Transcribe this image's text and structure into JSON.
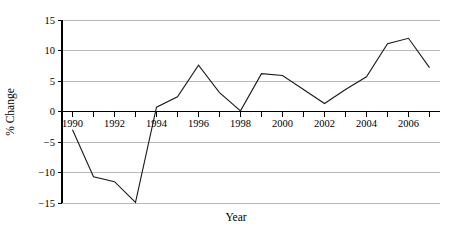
{
  "chart_data": {
    "type": "line",
    "title": "",
    "xlabel": "Year",
    "ylabel": "% Change",
    "xlim": [
      1989.5,
      2007.5
    ],
    "ylim": [
      -15,
      15
    ],
    "grid": true,
    "legend": false,
    "y_ticks": [
      15,
      10,
      5,
      0,
      -5,
      -10,
      -15
    ],
    "y_tick_labels": [
      "15",
      "10",
      "5",
      "0",
      "−5",
      "−10",
      "−15"
    ],
    "x_ticks": [
      1990,
      1991,
      1992,
      1993,
      1994,
      1995,
      1996,
      1997,
      1998,
      1999,
      2000,
      2001,
      2002,
      2003,
      2004,
      2005,
      2006,
      2007
    ],
    "x_tick_labels_shown": [
      "1990",
      "1992",
      "1994",
      "1996",
      "1998",
      "2000",
      "2002",
      "2004",
      "2006"
    ],
    "x_tick_labels_shown_values": [
      1990,
      1992,
      1994,
      1996,
      1998,
      2000,
      2002,
      2004,
      2006
    ],
    "x": [
      1990,
      1991,
      1992,
      1993,
      1994,
      1995,
      1996,
      1997,
      1998,
      1999,
      2000,
      2001,
      2002,
      2003,
      2004,
      2005,
      2006,
      2007
    ],
    "values": [
      -3.0,
      -10.7,
      -11.5,
      -14.9,
      0.7,
      2.4,
      7.6,
      3.1,
      0.1,
      6.2,
      5.9,
      3.6,
      1.3,
      3.6,
      5.7,
      11.1,
      12.0,
      7.2
    ],
    "series": [
      {
        "name": "% Change",
        "values": [
          -3.0,
          -10.7,
          -11.5,
          -14.9,
          0.7,
          2.4,
          7.6,
          3.1,
          0.1,
          6.2,
          5.9,
          3.6,
          1.3,
          3.6,
          5.7,
          11.1,
          12.0,
          7.2
        ]
      }
    ],
    "line_color": "#1a1a1a",
    "grid_color": "#a9a9a9",
    "axis_color": "#000000",
    "background_color": "#ffffff"
  },
  "layout": {
    "plot_left": 62,
    "plot_right": 440,
    "plot_top": 20,
    "plot_bottom": 203,
    "zero_y": 110,
    "x_label_y": 127,
    "axis_title_y": 221
  }
}
